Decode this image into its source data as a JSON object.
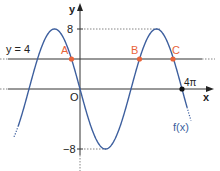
{
  "diagram": {
    "function_label": "f(x)",
    "function_formula": "-8 sin(x/2)",
    "axes": {
      "x_label": "x",
      "y_label": "y",
      "origin_label": "O",
      "y_max_label": "8",
      "y_min_label": "−8",
      "x_mark_label": "4π"
    },
    "line": {
      "label": "y = 4",
      "value": 4
    },
    "points": [
      {
        "label": "A",
        "x": "-π/3",
        "y": 4
      },
      {
        "label": "B",
        "x": "7π/3",
        "y": 4
      },
      {
        "label": "C",
        "x": "11π/3",
        "y": 4
      }
    ],
    "colors": {
      "curve": "#3d5f9e",
      "points": "#e8643a",
      "point_labels": "#e8643a",
      "axes": "#222222",
      "line": "#333333",
      "dotted": "#555555"
    }
  }
}
